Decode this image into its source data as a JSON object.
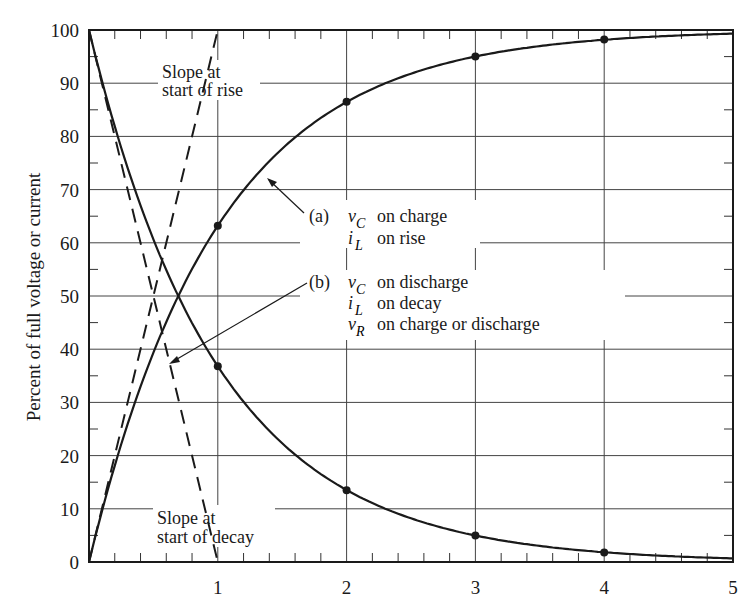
{
  "chart_data": {
    "type": "line",
    "title": "",
    "xlabel": "",
    "ylabel": "Percent of full voltage or current",
    "xlim": [
      0,
      5
    ],
    "ylim": [
      0,
      100
    ],
    "grid": true,
    "x_ticks": [
      "1",
      "2",
      "3",
      "4",
      "5"
    ],
    "y_ticks": [
      "0",
      "10",
      "20",
      "30",
      "40",
      "50",
      "60",
      "70",
      "80",
      "90",
      "100"
    ],
    "x": [
      0,
      1,
      2,
      3,
      4,
      5
    ],
    "series": [
      {
        "name": "(a) vC on charge / iL on rise",
        "style": "solid",
        "values": [
          0,
          63.2,
          86.5,
          95.0,
          98.2,
          99.3
        ],
        "marked_points": [
          1,
          2,
          3,
          4
        ]
      },
      {
        "name": "(b) vC on discharge / iL on decay / vR on charge or discharge",
        "style": "solid",
        "values": [
          100,
          36.8,
          13.5,
          5.0,
          1.8,
          0.7
        ],
        "marked_points": [
          1,
          2,
          3,
          4
        ]
      },
      {
        "name": "Slope at start of rise",
        "style": "dashed",
        "x": [
          0,
          1
        ],
        "values": [
          0,
          100
        ]
      },
      {
        "name": "Slope at start of decay",
        "style": "dashed",
        "x": [
          0,
          1
        ],
        "values": [
          100,
          0
        ]
      }
    ],
    "annotations": {
      "slope_rise": [
        "Slope at",
        "start of rise"
      ],
      "slope_decay": [
        "Slope at",
        "start of decay"
      ],
      "label_a": {
        "tag": "(a)",
        "lines": [
          {
            "var": "v",
            "sub": "C",
            "text": "on charge"
          },
          {
            "var": "i",
            "sub": "L",
            "text": "on rise"
          }
        ]
      },
      "label_b": {
        "tag": "(b)",
        "lines": [
          {
            "var": "v",
            "sub": "C",
            "text": "on discharge"
          },
          {
            "var": "i",
            "sub": "L",
            "text": "on decay"
          },
          {
            "var": "v",
            "sub": "R",
            "text": "on charge or discharge"
          }
        ]
      }
    },
    "legend_position": "inline annotations"
  }
}
